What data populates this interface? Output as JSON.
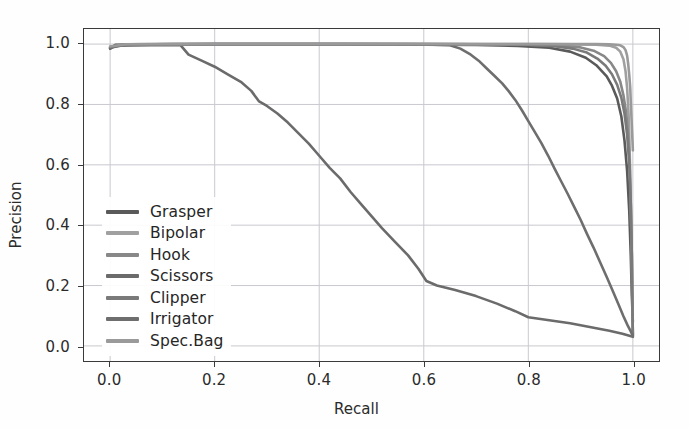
{
  "figure": {
    "background": "#fefefe",
    "axes_color": "#3a3a3a",
    "grid_color": "#c9c9cf",
    "text_color": "#2b2b2b"
  },
  "chart_data": {
    "type": "line",
    "title": "",
    "xlabel": "Recall",
    "ylabel": "Precision",
    "xlim": [
      -0.05,
      1.05
    ],
    "ylim": [
      -0.05,
      1.05
    ],
    "xticks": [
      "0.0",
      "0.2",
      "0.4",
      "0.6",
      "0.8",
      "1.0"
    ],
    "xtick_values": [
      0.0,
      0.2,
      0.4,
      0.6,
      0.8,
      1.0
    ],
    "yticks": [
      "0.0",
      "0.2",
      "0.4",
      "0.6",
      "0.8",
      "1.0"
    ],
    "ytick_values": [
      0.0,
      0.2,
      0.4,
      0.6,
      0.8,
      1.0
    ],
    "grid": true,
    "legend_position": "center left",
    "series": [
      {
        "name": "Grasper",
        "color": "#5a5a5a",
        "points": [
          [
            0.0,
            0.985
          ],
          [
            0.01,
            0.998
          ],
          [
            0.05,
            0.999
          ],
          [
            0.15,
            0.999
          ],
          [
            0.3,
            0.999
          ],
          [
            0.45,
            0.999
          ],
          [
            0.6,
            0.998
          ],
          [
            0.7,
            0.997
          ],
          [
            0.78,
            0.994
          ],
          [
            0.84,
            0.988
          ],
          [
            0.88,
            0.975
          ],
          [
            0.91,
            0.955
          ],
          [
            0.93,
            0.93
          ],
          [
            0.95,
            0.893
          ],
          [
            0.96,
            0.862
          ],
          [
            0.97,
            0.82
          ],
          [
            0.978,
            0.76
          ],
          [
            0.984,
            0.68
          ],
          [
            0.989,
            0.58
          ],
          [
            0.993,
            0.45
          ],
          [
            0.996,
            0.3
          ],
          [
            0.998,
            0.17
          ],
          [
            1.0,
            0.08
          ]
        ]
      },
      {
        "name": "Bipolar",
        "color": "#a0a0a0",
        "points": [
          [
            0.0,
            0.99
          ],
          [
            0.02,
            0.999
          ],
          [
            0.1,
            1.0
          ],
          [
            0.3,
            1.0
          ],
          [
            0.5,
            1.0
          ],
          [
            0.7,
            1.0
          ],
          [
            0.82,
            1.0
          ],
          [
            0.89,
            0.999
          ],
          [
            0.93,
            0.998
          ],
          [
            0.955,
            0.995
          ],
          [
            0.968,
            0.988
          ],
          [
            0.976,
            0.975
          ],
          [
            0.982,
            0.95
          ],
          [
            0.986,
            0.91
          ],
          [
            0.989,
            0.855
          ],
          [
            0.992,
            0.76
          ],
          [
            0.994,
            0.64
          ],
          [
            0.996,
            0.48
          ],
          [
            0.998,
            0.3
          ],
          [
            0.999,
            0.15
          ],
          [
            1.0,
            0.035
          ]
        ]
      },
      {
        "name": "Hook",
        "color": "#888888",
        "points": [
          [
            0.0,
            0.988
          ],
          [
            0.02,
            0.998
          ],
          [
            0.12,
            1.0
          ],
          [
            0.35,
            1.0
          ],
          [
            0.55,
            1.0
          ],
          [
            0.7,
            0.999
          ],
          [
            0.8,
            0.998
          ],
          [
            0.86,
            0.995
          ],
          [
            0.9,
            0.989
          ],
          [
            0.925,
            0.978
          ],
          [
            0.945,
            0.96
          ],
          [
            0.958,
            0.938
          ],
          [
            0.968,
            0.91
          ],
          [
            0.976,
            0.875
          ],
          [
            0.982,
            0.83
          ],
          [
            0.987,
            0.775
          ],
          [
            0.991,
            0.7
          ],
          [
            0.994,
            0.6
          ],
          [
            0.996,
            0.47
          ],
          [
            0.998,
            0.3
          ],
          [
            0.999,
            0.15
          ],
          [
            1.0,
            0.038
          ]
        ]
      },
      {
        "name": "Scissors",
        "color": "#6b6b6b",
        "points": [
          [
            0.0,
            0.985
          ],
          [
            0.01,
            0.995
          ],
          [
            0.08,
            0.996
          ],
          [
            0.135,
            0.996
          ],
          [
            0.15,
            0.965
          ],
          [
            0.175,
            0.945
          ],
          [
            0.2,
            0.925
          ],
          [
            0.225,
            0.9
          ],
          [
            0.25,
            0.875
          ],
          [
            0.27,
            0.845
          ],
          [
            0.285,
            0.81
          ],
          [
            0.3,
            0.795
          ],
          [
            0.32,
            0.77
          ],
          [
            0.34,
            0.74
          ],
          [
            0.36,
            0.705
          ],
          [
            0.38,
            0.67
          ],
          [
            0.4,
            0.63
          ],
          [
            0.42,
            0.59
          ],
          [
            0.44,
            0.555
          ],
          [
            0.46,
            0.51
          ],
          [
            0.48,
            0.47
          ],
          [
            0.5,
            0.43
          ],
          [
            0.52,
            0.39
          ],
          [
            0.545,
            0.345
          ],
          [
            0.57,
            0.3
          ],
          [
            0.59,
            0.255
          ],
          [
            0.605,
            0.215
          ],
          [
            0.625,
            0.2
          ],
          [
            0.66,
            0.185
          ],
          [
            0.7,
            0.165
          ],
          [
            0.74,
            0.14
          ],
          [
            0.775,
            0.115
          ],
          [
            0.8,
            0.095
          ],
          [
            0.84,
            0.085
          ],
          [
            0.88,
            0.075
          ],
          [
            0.92,
            0.062
          ],
          [
            0.955,
            0.05
          ],
          [
            0.98,
            0.04
          ],
          [
            1.0,
            0.03
          ]
        ]
      },
      {
        "name": "Clipper",
        "color": "#7a7a7a",
        "points": [
          [
            0.0,
            0.99
          ],
          [
            0.03,
            0.999
          ],
          [
            0.15,
            1.0
          ],
          [
            0.4,
            1.0
          ],
          [
            0.6,
            1.0
          ],
          [
            0.72,
            0.999
          ],
          [
            0.8,
            0.997
          ],
          [
            0.85,
            0.993
          ],
          [
            0.885,
            0.985
          ],
          [
            0.912,
            0.972
          ],
          [
            0.932,
            0.952
          ],
          [
            0.948,
            0.928
          ],
          [
            0.96,
            0.9
          ],
          [
            0.97,
            0.865
          ],
          [
            0.978,
            0.822
          ],
          [
            0.984,
            0.77
          ],
          [
            0.989,
            0.7
          ],
          [
            0.993,
            0.605
          ],
          [
            0.996,
            0.47
          ],
          [
            0.998,
            0.3
          ],
          [
            0.999,
            0.14
          ],
          [
            1.0,
            0.032
          ]
        ]
      },
      {
        "name": "Irrigator",
        "color": "#6e6e6e",
        "points": [
          [
            0.0,
            0.988
          ],
          [
            0.03,
            0.998
          ],
          [
            0.2,
            1.0
          ],
          [
            0.45,
            1.0
          ],
          [
            0.6,
            0.999
          ],
          [
            0.65,
            0.996
          ],
          [
            0.67,
            0.985
          ],
          [
            0.69,
            0.965
          ],
          [
            0.705,
            0.945
          ],
          [
            0.72,
            0.92
          ],
          [
            0.735,
            0.895
          ],
          [
            0.75,
            0.87
          ],
          [
            0.762,
            0.845
          ],
          [
            0.775,
            0.815
          ],
          [
            0.788,
            0.78
          ],
          [
            0.8,
            0.745
          ],
          [
            0.812,
            0.71
          ],
          [
            0.825,
            0.672
          ],
          [
            0.838,
            0.63
          ],
          [
            0.85,
            0.588
          ],
          [
            0.862,
            0.548
          ],
          [
            0.875,
            0.505
          ],
          [
            0.888,
            0.46
          ],
          [
            0.9,
            0.418
          ],
          [
            0.912,
            0.372
          ],
          [
            0.925,
            0.325
          ],
          [
            0.938,
            0.275
          ],
          [
            0.95,
            0.228
          ],
          [
            0.962,
            0.18
          ],
          [
            0.972,
            0.14
          ],
          [
            0.982,
            0.098
          ],
          [
            0.99,
            0.068
          ],
          [
            0.996,
            0.048
          ],
          [
            1.0,
            0.033
          ]
        ]
      },
      {
        "name": "Spec.Bag",
        "color": "#9a9a9a",
        "points": [
          [
            0.0,
            0.992
          ],
          [
            0.03,
            0.999
          ],
          [
            0.2,
            1.0
          ],
          [
            0.5,
            1.0
          ],
          [
            0.75,
            1.0
          ],
          [
            0.88,
            1.0
          ],
          [
            0.93,
            1.0
          ],
          [
            0.955,
            0.999
          ],
          [
            0.968,
            0.998
          ],
          [
            0.976,
            0.996
          ],
          [
            0.982,
            0.99
          ],
          [
            0.986,
            0.98
          ],
          [
            0.989,
            0.962
          ],
          [
            0.991,
            0.935
          ],
          [
            0.993,
            0.9
          ],
          [
            0.995,
            0.855
          ],
          [
            0.996,
            0.81
          ],
          [
            0.997,
            0.77
          ],
          [
            0.998,
            0.73
          ],
          [
            0.999,
            0.69
          ],
          [
            1.0,
            0.648
          ]
        ]
      }
    ]
  },
  "legend": {
    "items": [
      {
        "label": "Grasper",
        "color": "#5a5a5a"
      },
      {
        "label": "Bipolar",
        "color": "#a0a0a0"
      },
      {
        "label": "Hook",
        "color": "#888888"
      },
      {
        "label": "Scissors",
        "color": "#6b6b6b"
      },
      {
        "label": "Clipper",
        "color": "#7a7a7a"
      },
      {
        "label": "Irrigator",
        "color": "#6e6e6e"
      },
      {
        "label": "Spec.Bag",
        "color": "#9a9a9a"
      }
    ]
  }
}
